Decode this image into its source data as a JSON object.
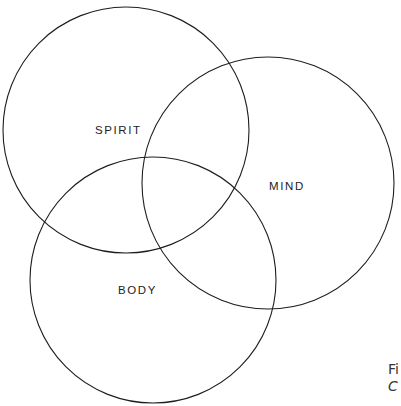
{
  "diagram": {
    "type": "venn",
    "sets": [
      {
        "label": "SPIRIT",
        "cx": 126,
        "cy": 130,
        "r": 123,
        "label_x": 95,
        "label_y": 134
      },
      {
        "label": "MIND",
        "cx": 268,
        "cy": 183,
        "r": 126,
        "label_x": 269,
        "label_y": 190
      },
      {
        "label": "BODY",
        "cx": 153,
        "cy": 280,
        "r": 123,
        "label_x": 118,
        "label_y": 294
      }
    ],
    "stroke_color": "#1e1e1e",
    "background": "#ffffff"
  },
  "caption": {
    "line1": "Fi",
    "line2": "C",
    "line3": "…"
  }
}
